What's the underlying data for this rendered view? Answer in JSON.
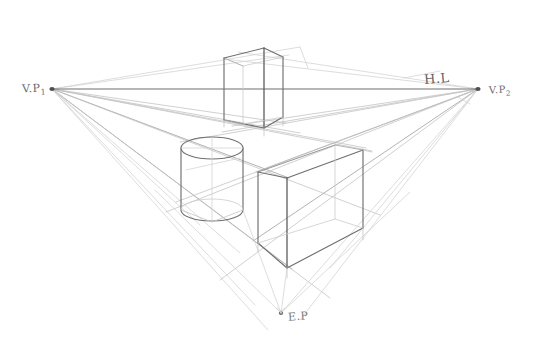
{
  "drawing": {
    "title_visible": false,
    "medium": "pencil-sketch",
    "background_color": "#ffffff",
    "line_color_dark": "#6b6b6b",
    "line_color_mid": "#9a9a9a",
    "line_color_faint": "#c9c9c9",
    "canvas": {
      "width": 533,
      "height": 350
    }
  },
  "labels": {
    "vp_left": {
      "text": "V.P",
      "subscript": "1"
    },
    "vp_right": {
      "text": "V.P",
      "subscript": "2"
    },
    "horizon": {
      "text": "H.L"
    },
    "eye_point": {
      "text": "E.P"
    }
  },
  "points": {
    "vp_left": {
      "x": 52,
      "y": 89
    },
    "vp_right": {
      "x": 478,
      "y": 89
    },
    "eye_point": {
      "x": 281,
      "y": 313
    }
  },
  "horizon_line": {
    "name": "horizon-line",
    "x1": 52,
    "y1": 89,
    "x2": 478,
    "y2": 89
  },
  "objects": [
    {
      "name": "tall-box",
      "type": "rectangular-prism",
      "position": "above-and-across-horizon",
      "front_corner_x": 264,
      "top_y": 48,
      "bottom_y": 126,
      "left_edge_x": 224,
      "right_edge_x": 283
    },
    {
      "name": "cylinder",
      "type": "cylinder",
      "center_x": 212,
      "top_ellipse_y": 148,
      "bottom_ellipse_y": 212,
      "radius_x": 31,
      "radius_y": 11
    },
    {
      "name": "wide-box",
      "type": "rectangular-prism",
      "position": "below-horizon-right",
      "front_corner_x": 287,
      "front_top_y": 178,
      "front_bottom_y": 268,
      "back_left_x": 258,
      "back_right_x": 363
    }
  ]
}
